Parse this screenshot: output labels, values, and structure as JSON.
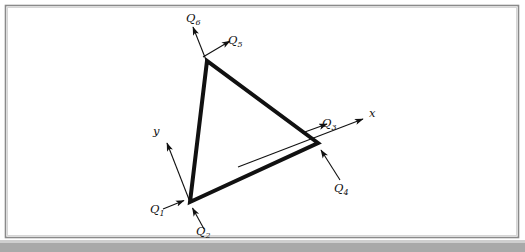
{
  "figure": {
    "kind": "engineering-diagram",
    "background_color": "#ffffff",
    "ink_color": "#111111",
    "frame": {
      "border_color": "#8a8a8a",
      "inner_border_color": "#c8c8c8",
      "x": 5,
      "y": 5,
      "width": 514,
      "height": 233
    },
    "page_edge_band": {
      "color": "#a9a9a9",
      "height": 9
    }
  },
  "geometry": {
    "element_stroke_width": 4,
    "arrow_stroke_width": 1.1,
    "axis_stroke_width": 1.1,
    "nodes": [
      {
        "id": "node-1",
        "label": "bottom-left",
        "x": 190,
        "y": 202
      },
      {
        "id": "node-2",
        "label": "right",
        "x": 318,
        "y": 143
      },
      {
        "id": "node-3",
        "label": "top",
        "x": 207,
        "y": 61
      }
    ],
    "triangle_path": "M 190 202 L 318 143 L 207 61 Z",
    "local_axes": {
      "origin_x": 190,
      "origin_y": 202,
      "x_axis": {
        "from_x": 238,
        "from_y": 167,
        "to_x": 366,
        "to_y": 118
      },
      "y_axis": {
        "from_x": 190,
        "from_y": 202,
        "to_x": 166,
        "to_y": 141
      }
    }
  },
  "labels": {
    "axes": [
      {
        "name": "x-axis-label",
        "text": "x",
        "sub": "",
        "x": 369,
        "y": 117
      },
      {
        "name": "y-axis-label",
        "text": "y",
        "sub": "",
        "x": 153,
        "y": 135
      }
    ],
    "dofs": [
      {
        "name": "dof-q1",
        "text": "Q",
        "sub": "1",
        "x": 150,
        "y": 213,
        "node": "node-1",
        "direction": "local-x"
      },
      {
        "name": "dof-q2",
        "text": "Q",
        "sub": "2",
        "x": 196,
        "y": 235,
        "node": "node-1",
        "direction": "local-y"
      },
      {
        "name": "dof-q3",
        "text": "Q",
        "sub": "3",
        "x": 322,
        "y": 127,
        "node": "node-2",
        "direction": "local-x"
      },
      {
        "name": "dof-q4",
        "text": "Q",
        "sub": "4",
        "x": 334,
        "y": 192,
        "node": "node-2",
        "direction": "local-y"
      },
      {
        "name": "dof-q5",
        "text": "Q",
        "sub": "5",
        "x": 228,
        "y": 44,
        "node": "node-3",
        "direction": "local-x"
      },
      {
        "name": "dof-q6",
        "text": "Q",
        "sub": "6",
        "x": 186,
        "y": 22,
        "node": "node-3",
        "direction": "local-y"
      }
    ]
  },
  "arrows": {
    "q1": {
      "from_x": 163,
      "from_y": 209,
      "to_x": 186,
      "to_y": 200
    },
    "q2": {
      "from_x": 204,
      "from_y": 229,
      "to_x": 192,
      "to_y": 207
    },
    "q3": {
      "from_x": 302,
      "from_y": 133,
      "to_x": 329,
      "to_y": 123
    },
    "q4": {
      "from_x": 340,
      "from_y": 180,
      "to_x": 321,
      "to_y": 148
    },
    "q5": {
      "from_x": 203,
      "from_y": 57,
      "to_x": 232,
      "to_y": 40
    },
    "q6": {
      "from_x": 208,
      "from_y": 65,
      "to_x": 192,
      "to_y": 25
    }
  }
}
